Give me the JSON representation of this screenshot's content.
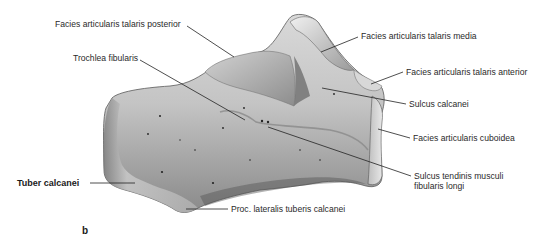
{
  "figure": {
    "panel_label": "b",
    "colors": {
      "background": "#ffffff",
      "bone_light": "#e6e6e6",
      "bone_mid": "#b8b8b8",
      "bone_dark": "#6e6e6e",
      "label_text": "#2a2a2a",
      "leader_line": "#222222"
    },
    "labels": [
      {
        "id": "facies-articularis-talaris-posterior",
        "text": "Facies articularis talaris posterior",
        "bold": false
      },
      {
        "id": "trochlea-fibularis",
        "text": "Trochlea fibularis",
        "bold": false
      },
      {
        "id": "facies-articularis-talaris-media",
        "text": "Facies articularis talaris media",
        "bold": false
      },
      {
        "id": "facies-articularis-talaris-anterior",
        "text": "Facies articularis talaris anterior",
        "bold": false
      },
      {
        "id": "sulcus-calcanei",
        "text": "Sulcus calcanei",
        "bold": false
      },
      {
        "id": "facies-articularis-cuboidea",
        "text": "Facies articularis cuboidea",
        "bold": false
      },
      {
        "id": "sulcus-tendinis-musculi-fibularis-longi",
        "text": "Sulcus tendinis musculi",
        "text2": "fibularis longi",
        "bold": false
      },
      {
        "id": "tuber-calcanei",
        "text": "Tuber calcanei",
        "bold": true
      },
      {
        "id": "proc-lateralis-tuberis-calcanei",
        "text": "Proc. lateralis tuberis calcanei",
        "bold": false
      }
    ]
  }
}
